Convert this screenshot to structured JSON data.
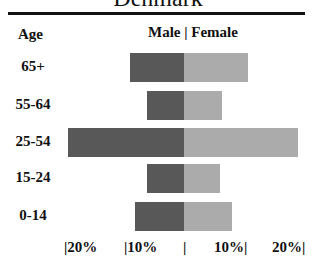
{
  "title": "Denmark",
  "headers": {
    "age": "Age",
    "sex": "Male | Female"
  },
  "colors": {
    "male": "#585858",
    "female": "#ababab"
  },
  "axis": {
    "ticks": [
      "|20%",
      "|10%",
      "|",
      "10%|",
      "20%|"
    ]
  },
  "chart_data": {
    "type": "bar",
    "orientation": "horizontal-population-pyramid",
    "title": "Denmark",
    "categories": [
      "65+",
      "55-64",
      "25-54",
      "15-24",
      "0-14"
    ],
    "series": [
      {
        "name": "Male",
        "values": [
          9.0,
          6.2,
          19.3,
          6.2,
          8.2
        ]
      },
      {
        "name": "Female",
        "values": [
          10.7,
          6.3,
          19.0,
          6.0,
          8.0
        ]
      }
    ],
    "xlabel": "",
    "ylabel": "Age",
    "xticks": [
      "20%",
      "10%",
      "0",
      "10%",
      "20%"
    ],
    "xlim": [
      -20,
      20
    ],
    "grid": false,
    "legend": "Male | Female (header)"
  },
  "rows": [
    {
      "label": "65+"
    },
    {
      "label": "55-64"
    },
    {
      "label": "25-54"
    },
    {
      "label": "15-24"
    },
    {
      "label": "0-14"
    }
  ]
}
